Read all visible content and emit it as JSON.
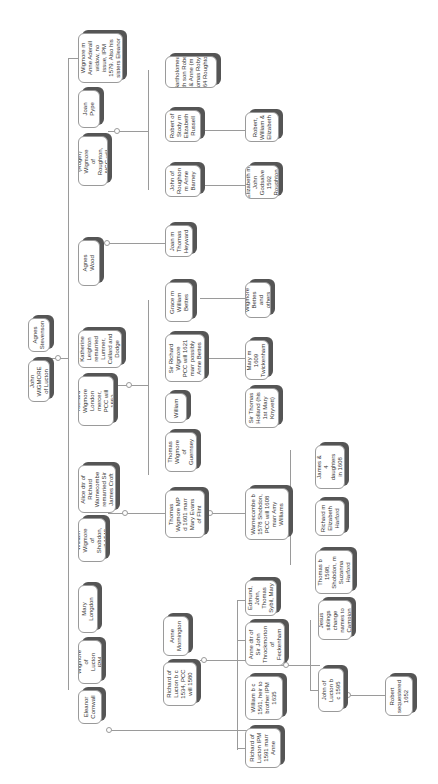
{
  "diagram": {
    "type": "family-tree",
    "orientation": "rotated-90",
    "nodes": [
      {
        "id": "thomas_w",
        "label": "Thomas Wigmore m Anne Aderall widow, no issue, IPM 1579. Also his sisters Eleanor & Sybil"
      },
      {
        "id": "joan_pype",
        "label": "Joan Pype"
      },
      {
        "id": "robert_roger",
        "label": "Robert (Roger) Wigmore of Roughton, NCC will 1572"
      },
      {
        "id": "bartholomew",
        "label": "Bartholomew (with son Robert) & Anne (m Thomas Robyns 1564 Roughton)"
      },
      {
        "id": "robert_stody",
        "label": "Robert of Stody m Elizabeth Russell"
      },
      {
        "id": "john_roughton",
        "label": "John of Roughton m Anne Barney"
      },
      {
        "id": "robert_wm_eliz",
        "label": "Robert, William & Elizabeth"
      },
      {
        "id": "elizabeth_godsalve",
        "label": "Elizabeth m John Godsalve 1592 Roughton"
      },
      {
        "id": "agnes_wood",
        "label": "Agnes Wood"
      },
      {
        "id": "joan_heyward",
        "label": "Joan m Thomas Heyward"
      },
      {
        "id": "agnes_stevenson",
        "label": "Agnes Stevenson"
      },
      {
        "id": "john_wigmore_lucton",
        "label": "John WIGMORE of Lucton"
      },
      {
        "id": "katherine_leighton",
        "label": "Katherine Leighton remarried Lumner, Callard and Dodge"
      },
      {
        "id": "richard_london",
        "label": "Richard Wigmore London mercer, PCC will 1553"
      },
      {
        "id": "grace_bettes",
        "label": "Grace m William Bettes"
      },
      {
        "id": "wigmore_bettes",
        "label": "Wigmore Bettes and others"
      },
      {
        "id": "sir_richard",
        "label": "Sir Richard Wigmore PCC will 1621 marr possibly Anne Bettes"
      },
      {
        "id": "mary_twickenham",
        "label": "Mary m 1609 Twickenham"
      },
      {
        "id": "sir_thomas_holland",
        "label": "Sir Thomas Holland (his 1st Mary Knyvett)"
      },
      {
        "id": "william_2",
        "label": "William"
      },
      {
        "id": "thomas_guernsey",
        "label": "Thomas Wigmore of Guernsey"
      },
      {
        "id": "alice_warnecombe",
        "label": "Alice dtr of Richard Warnecombe remarried Sir James Croft"
      },
      {
        "id": "william_shobdon",
        "label": "William Wigmore of Shobdon, will 1540"
      },
      {
        "id": "thomas_mp",
        "label": "Thomas Wigmore MP d 1601 marr Mary Evans of Flint"
      },
      {
        "id": "warnecombe_1578",
        "label": "Warnecombe b 1578 Shobdon, PCC will 1608 marr Amy Williams"
      },
      {
        "id": "henry_james",
        "label": "Henry, James & 4 daughters in 1608 will"
      },
      {
        "id": "richard_harford",
        "label": "Richard m Elizabeth Harford"
      },
      {
        "id": "thomas_1598",
        "label": "Thomas b 1598, Shobdon, m Suzanna Harford"
      },
      {
        "id": "mary_longdon",
        "label": "Mary Longdon"
      },
      {
        "id": "john_lucton_ipm",
        "label": "John Wigmore of Lucton IPM 1546"
      },
      {
        "id": "eleanor_cornwall",
        "label": "Eleanor Cornwall"
      },
      {
        "id": "anne_mornington",
        "label": "Anne Mornington"
      },
      {
        "id": "richard_lucton_1534",
        "label": "Richard of Lucton b c 1534, PCC will 1580"
      },
      {
        "id": "edmund_etc",
        "label": "Edmund, John, Thomas Sybil, Mary"
      },
      {
        "id": "anne_throckmorton",
        "label": "Anne dtr of Sir John Throckmorton of Feckenham"
      },
      {
        "id": "william_1561",
        "label": "William b c 1561, heir to brother IPM 1635"
      },
      {
        "id": "richard_lucton_ipm",
        "label": "Richard of Lucton IPM 1591 marr Anne"
      },
      {
        "id": "jesus_siblings",
        "label": "Jesus siblings change names to Campion"
      },
      {
        "id": "john_lucton_1595",
        "label": "John of Lucton b c 1595"
      },
      {
        "id": "robert_sequestered",
        "label": "Robert sequestered 1652"
      }
    ]
  }
}
